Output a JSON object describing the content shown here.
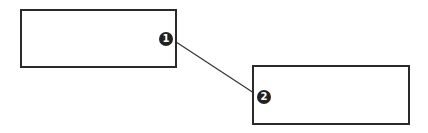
{
  "diagram": {
    "boxes": [
      {
        "id": "box-1",
        "badge": "1"
      },
      {
        "id": "box-2",
        "badge": "2"
      }
    ],
    "connector": {
      "from": "1",
      "to": "2",
      "color": "#2a2a2a"
    }
  }
}
